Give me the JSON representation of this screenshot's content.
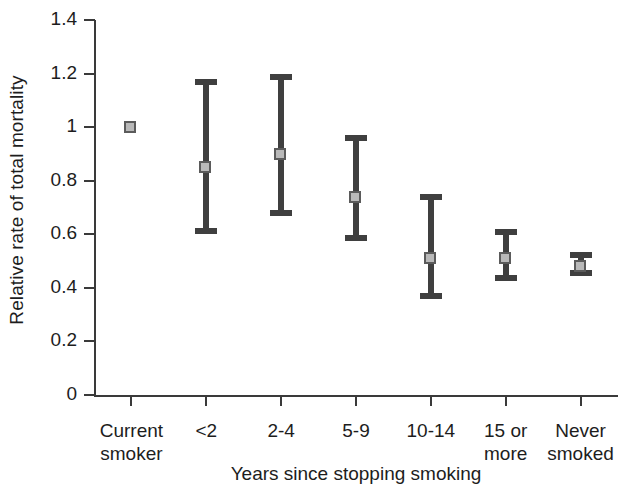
{
  "chart_data": {
    "type": "scatter",
    "title": "",
    "xlabel": "Years since stopping smoking",
    "ylabel": "Relative rate of total mortality",
    "categories": [
      "Current smoker",
      "<2",
      "2-4",
      "5-9",
      "10-14",
      "15 or more",
      "Never smoked"
    ],
    "category_lines": [
      [
        "Current",
        "smoker"
      ],
      [
        "<2"
      ],
      [
        "2-4"
      ],
      [
        "5-9"
      ],
      [
        "10-14"
      ],
      [
        "15 or",
        "more"
      ],
      [
        "Never",
        "smoked"
      ]
    ],
    "values": [
      1.0,
      0.85,
      0.9,
      0.74,
      0.51,
      0.51,
      0.48
    ],
    "ci_low": [
      1.0,
      0.6,
      0.67,
      0.575,
      0.36,
      0.425,
      0.445
    ],
    "ci_high": [
      1.0,
      1.18,
      1.2,
      0.97,
      0.75,
      0.62,
      0.535
    ],
    "has_error_bars": [
      false,
      true,
      true,
      true,
      true,
      true,
      true
    ],
    "ylim": [
      0,
      1.4
    ],
    "yticks": [
      0,
      0.2,
      0.4,
      0.6,
      0.8,
      1,
      1.2,
      1.4
    ],
    "ytick_labels": [
      "0",
      "0.2",
      "0.4",
      "0.6",
      "0.8",
      "1",
      "1.2",
      "1.4"
    ],
    "grid": false,
    "legend": "none",
    "marker_fill": "#b9b9b9",
    "marker_edge": "#5b5b5b",
    "bar_color": "#3f3f3f",
    "axis_color": "#3a3a3a",
    "note": "Point estimates with 95% confidence intervals; current smoker is the reference group fixed at 1"
  }
}
